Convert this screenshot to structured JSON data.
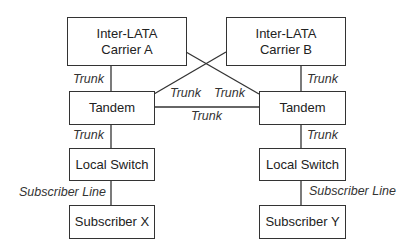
{
  "diagram": {
    "nodes": {
      "carrier_a": {
        "line1": "Inter-LATA",
        "line2": "Carrier A"
      },
      "carrier_b": {
        "line1": "Inter-LATA",
        "line2": "Carrier B"
      },
      "tandem_left": {
        "label": "Tandem"
      },
      "tandem_right": {
        "label": "Tandem"
      },
      "local_switch_left": {
        "label": "Local Switch"
      },
      "local_switch_right": {
        "label": "Local Switch"
      },
      "subscriber_x": {
        "label": "Subscriber X"
      },
      "subscriber_y": {
        "label": "Subscriber Y"
      }
    },
    "edges": {
      "carrier_a_tandem_left": "Trunk",
      "carrier_b_tandem_right": "Trunk",
      "carrier_b_tandem_left": "Trunk",
      "carrier_a_tandem_right": "Trunk",
      "tandem_tandem": "Trunk",
      "tandem_left_local_left": "Trunk",
      "tandem_right_local_right": "Trunk",
      "local_left_subscriber_x": "Subscriber Line",
      "local_right_subscriber_y": "Subscriber Line"
    },
    "colors": {
      "line": "#333333",
      "box_border": "#333333",
      "text": "#222222"
    }
  }
}
